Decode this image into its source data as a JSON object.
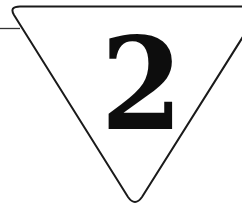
{
  "sign": {
    "shape": "inverted-triangle",
    "label": "2",
    "stroke_color": "#1a1a1a",
    "fill_color": "#ffffff",
    "text_color": "#0d0d0d"
  }
}
